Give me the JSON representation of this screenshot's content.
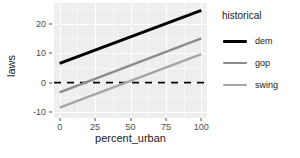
{
  "chart_data": {
    "type": "line",
    "title": "",
    "xlabel": "percent_urban",
    "ylabel": "laws",
    "xlim": [
      -4,
      104
    ],
    "ylim": [
      -12,
      27
    ],
    "xticks": [
      0,
      25,
      50,
      75,
      100
    ],
    "xticklabels": [
      "0",
      "25",
      "50",
      "75",
      "100"
    ],
    "yticks": [
      -10,
      0,
      10,
      20
    ],
    "yticklabels": [
      "-10",
      "0",
      "10",
      "20"
    ],
    "grid": true,
    "grid_color": "#ffffff",
    "panel_background": "#eeeeee",
    "legend": {
      "title": "historical",
      "position": "right",
      "entries": [
        {
          "name": "dem",
          "color": "#000000",
          "width": 3.0
        },
        {
          "name": "gop",
          "color": "#8c8c8c",
          "width": 2.4
        },
        {
          "name": "swing",
          "color": "#a6a6a6",
          "width": 2.4
        }
      ]
    },
    "x": [
      0,
      100
    ],
    "series": [
      {
        "name": "dem",
        "color": "#000000",
        "width": 3.0,
        "values": [
          6.5,
          24.5
        ]
      },
      {
        "name": "gop",
        "color": "#8c8c8c",
        "width": 2.4,
        "values": [
          -3.3,
          15.0
        ]
      },
      {
        "name": "swing",
        "color": "#a6a6a6",
        "width": 2.4,
        "values": [
          -8.5,
          9.7
        ]
      }
    ],
    "annotations": [
      {
        "type": "hline",
        "y": 0,
        "color": "#000000",
        "style": "dashed",
        "width": 1.6
      }
    ]
  }
}
